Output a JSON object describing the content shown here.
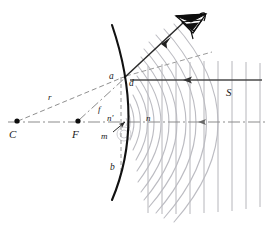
{
  "figure": {
    "background_color": "#ffffff",
    "width": 272,
    "height": 227
  },
  "colors": {
    "mirror": "#111111",
    "ray": "#4a4a4a",
    "wavefront_curved": "#b9b9bf",
    "wavefront_plane": "#b3b3b8",
    "axis": "#777777",
    "dashed": "#8a8a8a",
    "label": "#1a1a1a",
    "eye": "#0d0d0d"
  },
  "labels": {
    "center_of_curvature": "C",
    "focal_point": "F",
    "radius": "r",
    "focal_length": "f",
    "point_a": "a",
    "point_b": "b",
    "point_d": "d",
    "normal_prime": "n'",
    "normal": "n",
    "point_m": "m",
    "source_plane_wave": "S"
  },
  "points": {
    "C": {
      "x": 16,
      "y": 122
    },
    "F": {
      "x": 78,
      "y": 122
    },
    "a": {
      "x": 122,
      "y": 77
    },
    "d": {
      "x": 131,
      "y": 81
    },
    "vertex": {
      "x": 128,
      "y": 122
    },
    "m_arrow_tip": {
      "x": 126,
      "y": 121
    }
  },
  "elements": {
    "mirror_arc": "concave-mirror",
    "optical_axis": "dash-dot horizontal axis",
    "incident_ray": "horizontal ray travelling right-to-left with arrowhead",
    "reflected_ray": "ray from a going up-and-right with arrowhead",
    "dashed_radius": "dashed line C to a labelled r",
    "dashdot_focal": "dash-dot line F to a labelled f",
    "dashed_extension": "dashed normal extension beyond a",
    "normal_dashed_chord": "vertical dashed chord a-b",
    "eye": "observer eye symbol upper right",
    "plane_wavefronts": "vertical grey lines right of mirror",
    "curved_wavefronts": "concentric grey arcs converging toward F"
  },
  "counts": {
    "plane_wavefronts": 9,
    "curved_wavefronts": 11
  }
}
